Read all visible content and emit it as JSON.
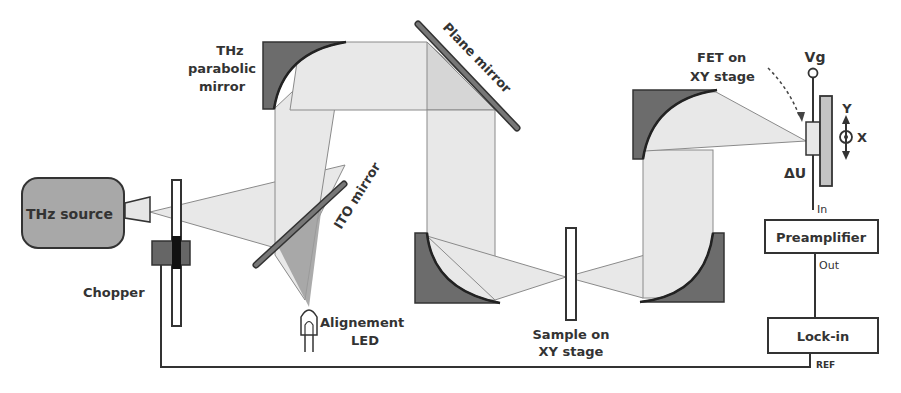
{
  "diagram": {
    "labels": {
      "thz_source": "THz source",
      "chopper": "Chopper",
      "parabolic_mirror_line1": "THz",
      "parabolic_mirror_line2": "parabolic",
      "parabolic_mirror_line3": "mirror",
      "ito_mirror": "ITO mirror",
      "plane_mirror": "Plane mirror",
      "led_line1": "Alignement",
      "led_line2": "LED",
      "sample_line1": "Sample on",
      "sample_line2": "XY stage",
      "fet_line1": "FET on",
      "fet_line2": "XY stage",
      "vg": "Vg",
      "delta_u": "ΔU",
      "axis_y": "Y",
      "axis_x": "X",
      "preamp": "Preamplifier",
      "preamp_in": "In",
      "preamp_out": "Out",
      "lockin": "Lock-in",
      "ref": "REF"
    },
    "colors": {
      "beam": "#e8e8e8",
      "mirror_body": "#6c6c6c",
      "source_fill": "#a8a8a8",
      "led_beam": "#9c9c9c"
    }
  }
}
